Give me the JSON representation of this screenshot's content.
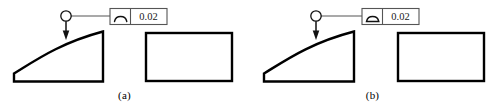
{
  "figure": {
    "background_color": "#ffffff",
    "line_color": "#000000",
    "frame_color": "#4d4d4d",
    "text_color": "#1a1a1a"
  },
  "panels": [
    {
      "id": "a",
      "caption": "(a)",
      "control_frame": {
        "symbol_name": "profile-of-a-line-symbol",
        "symbol_glyph": "open-arc",
        "tolerance_value": "0.02"
      },
      "leader": {
        "terminator_name": "circle-leader-origin",
        "arrow_name": "leader-arrowhead",
        "points_to": "curved-profile-edge"
      },
      "shapes": [
        {
          "name": "profiled-part-outline",
          "description": "part with concave curved top edge, flat base and vertical right side"
        },
        {
          "name": "plain-rectangle-outline",
          "description": "rectangular block outline"
        }
      ]
    },
    {
      "id": "b",
      "caption": "(b)",
      "control_frame": {
        "symbol_name": "profile-of-a-surface-symbol",
        "symbol_glyph": "closed-arc",
        "tolerance_value": "0.02"
      },
      "leader": {
        "terminator_name": "circle-leader-origin",
        "arrow_name": "leader-arrowhead",
        "points_to": "curved-profile-edge"
      },
      "shapes": [
        {
          "name": "profiled-part-outline",
          "description": "part with concave curved top edge, flat base and vertical right side"
        },
        {
          "name": "plain-rectangle-outline",
          "description": "rectangular block outline"
        }
      ]
    }
  ]
}
